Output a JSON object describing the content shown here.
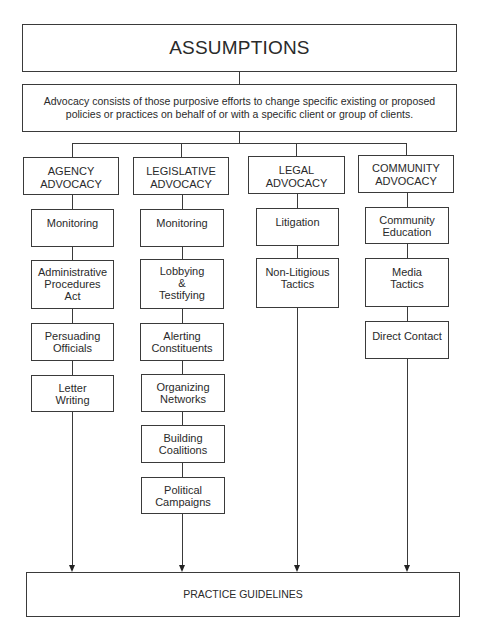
{
  "diagram": {
    "title": "ASSUMPTIONS",
    "definition": {
      "line1": "Advocacy consists of those purposive efforts to change specific existing or proposed",
      "line2": "policies or practices on behalf of or with a specific client or group of clients."
    },
    "columns": [
      {
        "header": [
          "AGENCY",
          "ADVOCACY"
        ],
        "items": [
          [
            "Monitoring"
          ],
          [
            "Administrative",
            "Procedures",
            "Act"
          ],
          [
            "Persuading",
            "Officials"
          ],
          [
            "Letter",
            "Writing"
          ]
        ]
      },
      {
        "header": [
          "LEGISLATIVE",
          "ADVOCACY"
        ],
        "items": [
          [
            "Monitoring"
          ],
          [
            "Lobbying",
            "&",
            "Testifying"
          ],
          [
            "Alerting",
            "Constituents"
          ],
          [
            "Organizing",
            "Networks"
          ],
          [
            "Building",
            "Coalitions"
          ],
          [
            "Political",
            "Campaigns"
          ]
        ]
      },
      {
        "header": [
          "LEGAL",
          "ADVOCACY"
        ],
        "items": [
          [
            "Litigation"
          ],
          [
            "Non-Litigious",
            "Tactics"
          ]
        ]
      },
      {
        "header": [
          "COMMUNITY",
          "ADVOCACY"
        ],
        "items": [
          [
            "Community",
            "Education"
          ],
          [
            "Media",
            "Tactics"
          ],
          [
            "Direct Contact"
          ]
        ]
      }
    ],
    "footer": "PRACTICE GUIDELINES",
    "colors": {
      "line": "#3a3a3a",
      "text": "#2a2a2a",
      "background": "#ffffff"
    }
  }
}
